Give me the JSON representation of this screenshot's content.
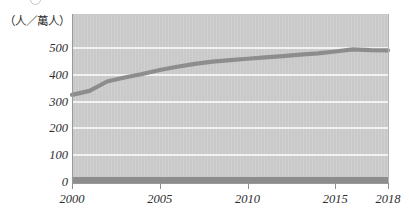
{
  "caption": {
    "sliver_text": "",
    "badge_icon": "circled-number-icon"
  },
  "axis_unit_label": "（人／萬人）",
  "chart_data": {
    "type": "line",
    "title": "",
    "xlabel": "",
    "ylabel": "（人／萬人）",
    "xlim": [
      2000,
      2018
    ],
    "ylim": [
      0,
      500
    ],
    "grid": true,
    "legend": false,
    "plot_background": "#cdcdcd",
    "line_color": "#8d8d8d",
    "gridline_color": "#f2f2f2",
    "ytick_labels": [
      "500",
      "400",
      "300",
      "200",
      "100",
      "0"
    ],
    "ytick_values": [
      500,
      400,
      300,
      200,
      100,
      0
    ],
    "xtick_labels": [
      "2000",
      "2005",
      "2010",
      "2015",
      "2018"
    ],
    "xtick_values": [
      2000,
      2005,
      2010,
      2015,
      2018
    ],
    "x": [
      2000,
      2001,
      2002,
      2003,
      2004,
      2005,
      2006,
      2007,
      2008,
      2009,
      2010,
      2011,
      2012,
      2013,
      2014,
      2015,
      2016,
      2017,
      2018
    ],
    "series": [
      {
        "name": "人數",
        "values": [
          325,
          340,
          375,
          390,
          403,
          418,
          430,
          441,
          449,
          455,
          460,
          465,
          470,
          475,
          480,
          487,
          495,
          492,
          491
        ]
      }
    ]
  }
}
